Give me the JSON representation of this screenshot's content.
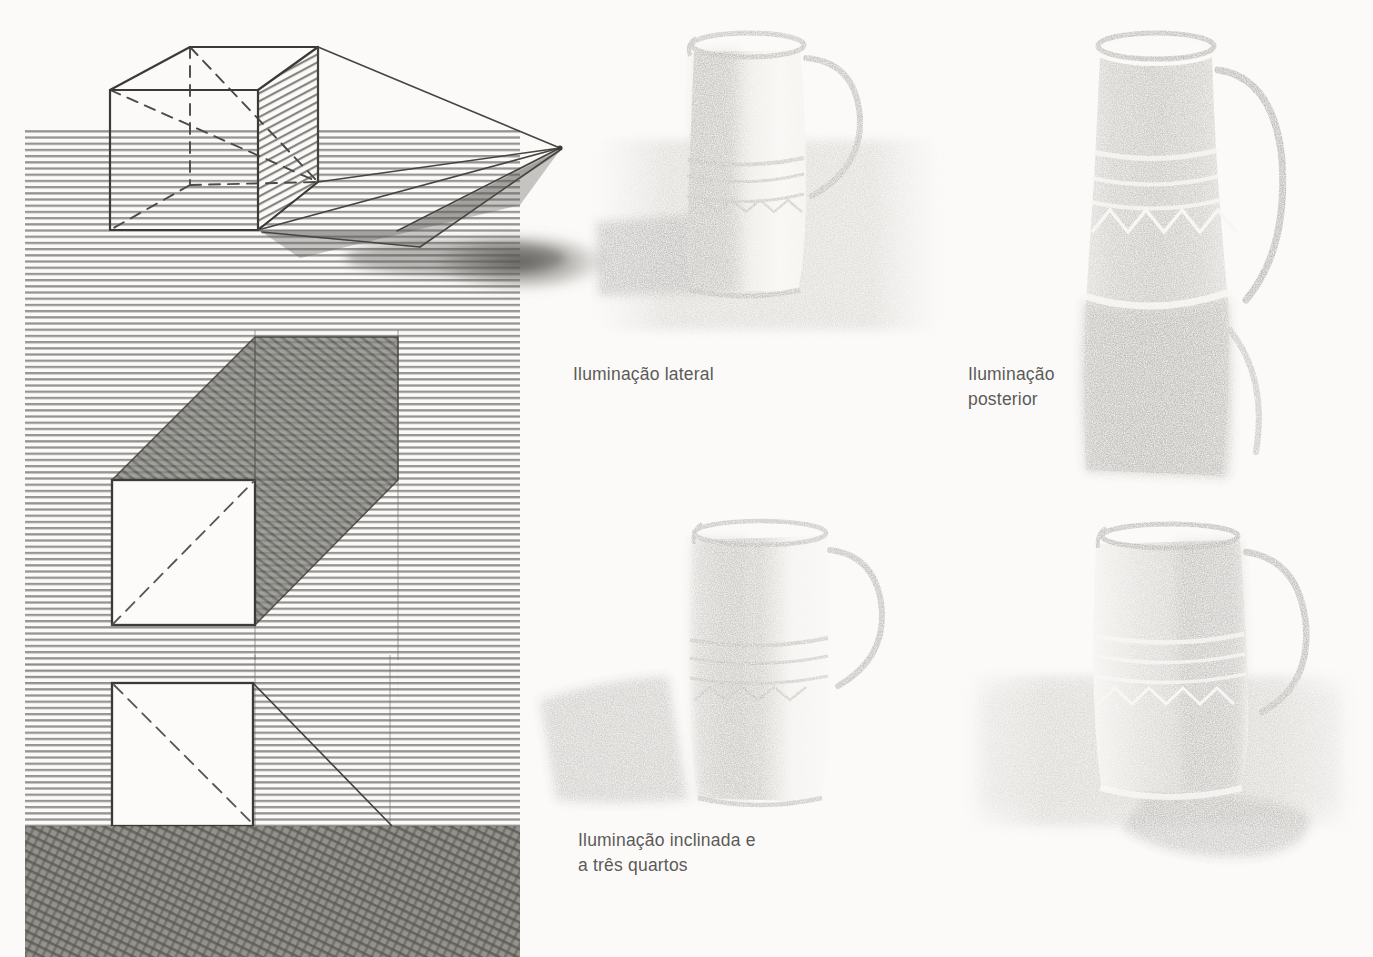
{
  "page": {
    "background_color": "#fbfaf8",
    "width": 1373,
    "height": 957,
    "medium": "pencil-drawing",
    "language": "pt-BR"
  },
  "colors": {
    "caption_text": "#5b5a58",
    "ink_line": "#3c3b39",
    "hatch_line": "#6f6e6c",
    "shadow_fill": "#8d8c89",
    "dark_band": "#77766f",
    "paper": "#fbfaf8"
  },
  "captions": [
    {
      "id": "lateral",
      "text": "Iluminação lateral",
      "x": 573,
      "y": 362
    },
    {
      "id": "posterior",
      "text": "Iluminação\nposterior",
      "x": 968,
      "y": 362
    },
    {
      "id": "inclinada",
      "text": "Iluminação inclinada e\na três quartos",
      "x": 578,
      "y": 828
    }
  ],
  "diagrams": [
    {
      "id": "cube-perspective-shadow",
      "name": "Cubo em perspectiva com sombra projetada",
      "position": {
        "x": 25,
        "y": 22,
        "width": 565,
        "height": 300
      },
      "elements": [
        "wireframe-cube",
        "hatched-right-face",
        "dashed-hidden-edges",
        "light-rays-to-vanishing-point",
        "cast-shadow-polygon",
        "horizontal-hatched-ground"
      ],
      "light_point": {
        "x": 560,
        "y": 148
      }
    },
    {
      "id": "square-with-parallelogram-shadow",
      "name": "Quadrado branco com sombra em paralelogramo a 45 graus",
      "position": {
        "x": 25,
        "y": 320,
        "width": 495,
        "height": 340
      },
      "square": {
        "x": 112,
        "y": 480,
        "width": 143,
        "height": 145
      },
      "shadow_angle_degrees": 45
    },
    {
      "id": "square-on-dark-ground",
      "name": "Quadrado branco sobre faixa escura com linha de projeção",
      "position": {
        "x": 25,
        "y": 660,
        "width": 495,
        "height": 296
      },
      "square": {
        "x": 112,
        "y": 683,
        "width": 141,
        "height": 143
      },
      "dark_band": {
        "y": 826,
        "height": 131
      }
    }
  ],
  "pitchers": [
    {
      "id": "pitcher-lateral",
      "name": "Jarro com iluminação lateral",
      "caption_id": "lateral",
      "position": {
        "x": 596,
        "y": 25,
        "width": 345,
        "height": 310
      },
      "light_direction": "right-side",
      "shadow_direction": "left",
      "features": [
        "rim",
        "handle-right",
        "decorative-band",
        "cast-shadow-left",
        "hatched-table"
      ]
    },
    {
      "id": "pitcher-posterior",
      "name": "Jarro com iluminação posterior",
      "caption_id": "posterior",
      "position": {
        "x": 1082,
        "y": 28,
        "width": 270,
        "height": 470
      },
      "light_direction": "behind",
      "shadow_direction": "toward-viewer",
      "features": [
        "bright-rim-highlight",
        "handle-right",
        "triangle-motif-band",
        "dark-body"
      ]
    },
    {
      "id": "pitcher-inclinada",
      "name": "Jarro com iluminação inclinada e a três quartos",
      "caption_id": "inclinada",
      "position": {
        "x": 540,
        "y": 510,
        "width": 360,
        "height": 300
      },
      "light_direction": "upper-right-three-quarter",
      "shadow_direction": "lower-left",
      "features": [
        "rim",
        "handle-right",
        "decorative-band",
        "long-cast-shadow-left"
      ]
    },
    {
      "id": "pitcher-fourth",
      "name": "Jarro sobre mesa sombreada",
      "caption_id": null,
      "position": {
        "x": 960,
        "y": 510,
        "width": 390,
        "height": 390
      },
      "light_direction": "upper-left",
      "shadow_direction": "lower-right",
      "features": [
        "rim",
        "handle-right",
        "decorative-band",
        "cast-shadow-right",
        "shaded-tabletop"
      ]
    }
  ]
}
